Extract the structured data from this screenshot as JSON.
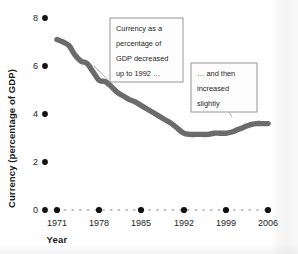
{
  "figure": {
    "background_color": "#fefefe",
    "line_color": "#6b6b6b",
    "tick_dot_color": "#111111",
    "grid_dot_color": "#b9b9b9",
    "callout_border_color": "#8d8d8d"
  },
  "axes": {
    "y_title": "Currency (percentage of GDP)",
    "x_title": "Year"
  },
  "callouts": [
    {
      "name": "callout-decrease",
      "lines": [
        "Currency as a",
        "percentage of",
        "GDP decreased",
        "up to 1992 …"
      ]
    },
    {
      "name": "callout-increase",
      "lines": [
        "… and then",
        "increased",
        "slightly"
      ]
    }
  ],
  "chart_data": {
    "type": "line",
    "title": "",
    "xlabel": "Year",
    "ylabel": "Currency (percentage of GDP)",
    "xlim": [
      1971,
      2006
    ],
    "ylim": [
      0,
      8
    ],
    "yticks": [
      0,
      2,
      4,
      6,
      8
    ],
    "ytick_labels": [
      "0",
      "2",
      "4",
      "6",
      "8"
    ],
    "xticks": [
      1971,
      1978,
      1985,
      1992,
      1999,
      2006
    ],
    "xtick_labels": [
      "1971",
      "1978",
      "1985",
      "1992",
      "1999",
      "2006"
    ],
    "grid": false,
    "legend": "none",
    "series": [
      {
        "name": "Currency as a percentage of GDP",
        "color": "#6b6b6b",
        "x": [
          1971,
          1972,
          1973,
          1974,
          1975,
          1976,
          1977,
          1978,
          1979,
          1980,
          1981,
          1982,
          1983,
          1984,
          1985,
          1986,
          1987,
          1988,
          1989,
          1990,
          1991,
          1992,
          1993,
          1994,
          1995,
          1996,
          1997,
          1998,
          1999,
          2000,
          2001,
          2002,
          2003,
          2004,
          2005,
          2006
        ],
        "values": [
          7.1,
          7.0,
          6.85,
          6.45,
          6.2,
          6.1,
          5.75,
          5.4,
          5.35,
          5.15,
          4.9,
          4.75,
          4.6,
          4.5,
          4.35,
          4.2,
          4.05,
          3.9,
          3.75,
          3.6,
          3.4,
          3.2,
          3.15,
          3.15,
          3.15,
          3.15,
          3.2,
          3.2,
          3.2,
          3.25,
          3.35,
          3.45,
          3.55,
          3.6,
          3.6,
          3.6
        ]
      }
    ],
    "annotations": [
      {
        "text": "Currency as a percentage of GDP decreased up to 1992 …",
        "points_to_year": 1977,
        "points_to_value": 5.6
      },
      {
        "text": "… and then increased slightly",
        "points_to_year": 1999,
        "points_to_value": 3.2
      }
    ]
  }
}
